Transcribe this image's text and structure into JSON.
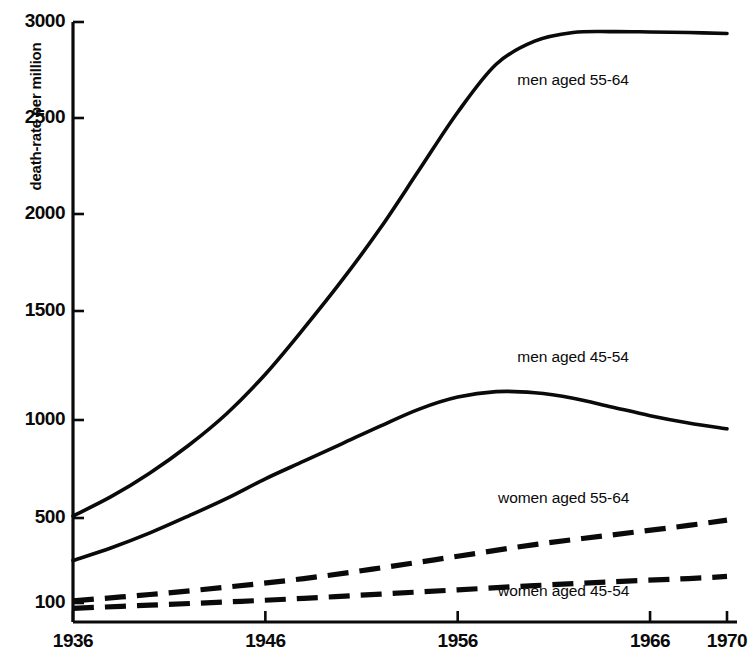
{
  "chart_data": {
    "type": "line",
    "title": "",
    "xlabel": "",
    "ylabel": "death-rate per million",
    "xlim": [
      1936,
      1970
    ],
    "ylim": [
      0,
      3000
    ],
    "grid": false,
    "legend_position": "inline-right",
    "x_ticks": [
      1936,
      1946,
      1956,
      1966,
      1970
    ],
    "x_tick_labels": [
      "1936",
      "1946",
      "1956",
      "1966",
      "1970"
    ],
    "y_ticks": [
      100,
      500,
      1000,
      1500,
      2000,
      2500,
      3000
    ],
    "y_tick_labels": [
      "100",
      "500",
      "1000",
      "1500",
      "2000",
      "2500",
      "3000"
    ],
    "series": [
      {
        "name": "men aged 55-64",
        "style": "solid",
        "color": "#0a0a0a",
        "x": [
          1936,
          1938,
          1940,
          1942,
          1944,
          1946,
          1948,
          1950,
          1952,
          1954,
          1956,
          1958,
          1960,
          1962,
          1964,
          1966,
          1968,
          1970
        ],
        "values": [
          510,
          610,
          730,
          870,
          1030,
          1210,
          1420,
          1660,
          1930,
          2230,
          2530,
          2780,
          2900,
          2945,
          2950,
          2948,
          2945,
          2940
        ]
      },
      {
        "name": "men aged 45-54",
        "style": "solid",
        "color": "#0a0a0a",
        "x": [
          1936,
          1938,
          1940,
          1942,
          1944,
          1946,
          1948,
          1950,
          1952,
          1954,
          1956,
          1958,
          1960,
          1962,
          1964,
          1966,
          1968,
          1970
        ],
        "values": [
          300,
          360,
          430,
          510,
          600,
          700,
          790,
          880,
          970,
          1050,
          1105,
          1130,
          1125,
          1100,
          1060,
          1020,
          985,
          955
        ]
      },
      {
        "name": "women aged 55-64",
        "style": "dashed",
        "color": "#0a0a0a",
        "x": [
          1936,
          1940,
          1944,
          1948,
          1952,
          1956,
          1960,
          1964,
          1968,
          1970
        ],
        "values": [
          110,
          140,
          175,
          215,
          265,
          320,
          375,
          420,
          465,
          490
        ]
      },
      {
        "name": "women aged 45-54",
        "style": "dashed",
        "color": "#0a0a0a",
        "x": [
          1936,
          1940,
          1944,
          1948,
          1952,
          1956,
          1960,
          1964,
          1968,
          1970
        ],
        "values": [
          75,
          90,
          105,
          122,
          142,
          162,
          182,
          200,
          215,
          225
        ]
      }
    ],
    "annotations": [
      {
        "text": "men aged 55-64",
        "x": 1963,
        "y": 2700
      },
      {
        "text": "men aged 45-54",
        "x": 1963,
        "y": 1290
      },
      {
        "text": "women aged 55-64",
        "x": 1962,
        "y": 600
      },
      {
        "text": "women aged 45-54",
        "x": 1962,
        "y": 155
      }
    ]
  },
  "axis": {
    "y_title": "death-rate per million",
    "y_tick_0": "100",
    "y_tick_1": "500",
    "y_tick_2": "1000",
    "y_tick_3": "1500",
    "y_tick_4": "2000",
    "y_tick_5": "2500",
    "y_tick_6": "3000",
    "x_tick_0": "1936",
    "x_tick_1": "1946",
    "x_tick_2": "1956",
    "x_tick_3": "1966",
    "x_tick_4": "1970"
  },
  "labels": {
    "men_55_64": "men aged 55-64",
    "men_45_54": "men aged 45-54",
    "women_55_64": "women aged 55-64",
    "women_45_54": "women aged 45-54"
  },
  "colors": {
    "ink": "#0a0a0a",
    "background": "#ffffff"
  }
}
